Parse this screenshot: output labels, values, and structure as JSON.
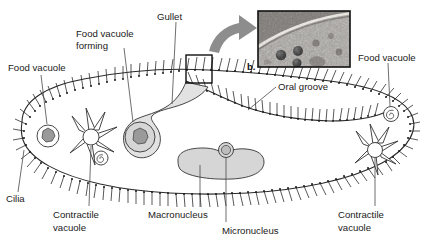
{
  "figure": {
    "panel_label": "b.",
    "background_color": "#ffffff",
    "ink_color": "#1a1a1a",
    "organelle_fill": "#d6d6d6",
    "arrow_color": "#8d8d8d"
  },
  "labels": {
    "food_vacuole_left": "Food vacuole",
    "food_vacuole_forming_line1": "Food vacuole",
    "food_vacuole_forming_line2": "forming",
    "gullet": "Gullet",
    "food_vacuole_right": "Food vacuole",
    "oral_groove": "Oral groove",
    "cilia": "Cilia",
    "contractile_vacuole_left_line1": "Contractile",
    "contractile_vacuole_left_line2": "vacuole",
    "macronucleus": "Macronucleus",
    "micronucleus": "Micronucleus",
    "contractile_vacuole_right_line1": "Contractile",
    "contractile_vacuole_right_line2": "vacuole"
  },
  "micrograph": {
    "caption": "b.",
    "description": "electron micrograph inset of cell surface with dark granules"
  }
}
